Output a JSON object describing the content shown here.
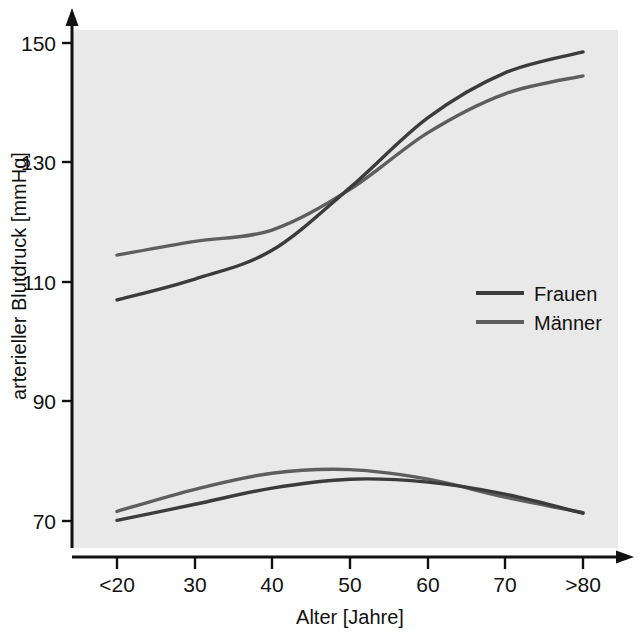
{
  "chart_data": {
    "type": "line",
    "title": "",
    "xlabel": "Alter [Jahre]",
    "ylabel": "arterieller Blutdruck [mmHg]",
    "x": [
      "<20",
      "30",
      "40",
      "50",
      "60",
      "70",
      ">80"
    ],
    "xtick_labels": [
      "<20",
      "30",
      "40",
      "50",
      "60",
      "70",
      ">80"
    ],
    "ytick_labels": [
      "70",
      "90",
      "110",
      "130",
      "150"
    ],
    "ytick_values": [
      70,
      90,
      110,
      130,
      150
    ],
    "ylim": [
      62,
      153
    ],
    "grid": false,
    "legend_position": "center-right",
    "series": [
      {
        "name": "Frauen",
        "measure": "systolisch",
        "color": "#3b3b3b",
        "values": [
          107.0,
          110.5,
          115.3,
          125.8,
          137.5,
          145.0,
          148.5
        ]
      },
      {
        "name": "Männer",
        "measure": "systolisch",
        "color": "#5e5e5e",
        "values": [
          114.5,
          116.8,
          118.7,
          125.5,
          135.0,
          141.5,
          144.5
        ]
      },
      {
        "name": "Frauen",
        "measure": "diastolisch",
        "color": "#3b3b3b",
        "values": [
          70.1,
          72.8,
          75.5,
          77.0,
          76.5,
          74.5,
          71.3
        ]
      },
      {
        "name": "Männer",
        "measure": "diastolisch",
        "color": "#5e5e5e",
        "values": [
          71.6,
          75.3,
          78.0,
          78.6,
          77.0,
          74.0,
          71.4
        ]
      }
    ],
    "legend": [
      {
        "label": "Frauen",
        "color": "#3b3b3b"
      },
      {
        "label": "Männer",
        "color": "#5e5e5e"
      }
    ],
    "plot_background_color": "#e9e9e9",
    "page_background_color": "#ffffff"
  }
}
